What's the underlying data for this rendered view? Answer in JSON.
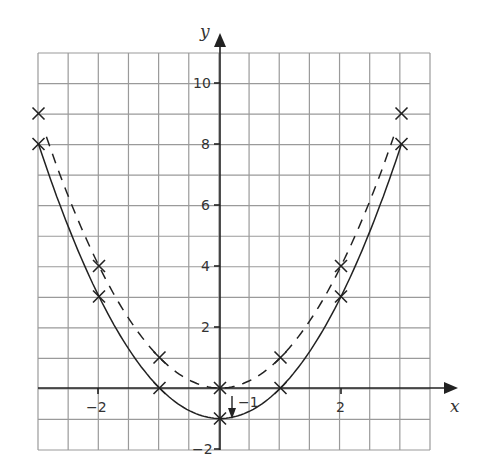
{
  "chart_data": {
    "type": "line",
    "title": "",
    "xlabel": "x",
    "ylabel": "y",
    "xlim": [
      -3,
      3.5
    ],
    "ylim": [
      -2,
      11
    ],
    "grid": true,
    "x_tick_labels": [
      "-2",
      "2"
    ],
    "y_tick_labels": [
      "-2",
      "2",
      "4",
      "6",
      "8",
      "10"
    ],
    "series": [
      {
        "name": "y = x^2",
        "style": "dashed",
        "marker": "x",
        "x": [
          -3,
          -2,
          -1,
          0,
          1,
          2,
          3
        ],
        "y": [
          9,
          4,
          1,
          0,
          1,
          4,
          9
        ]
      },
      {
        "name": "y = x^2 - 1",
        "style": "solid",
        "marker": "x",
        "x": [
          -3,
          -2,
          -1,
          0,
          1,
          2,
          3
        ],
        "y": [
          8,
          3,
          0,
          -1,
          0,
          3,
          8
        ]
      }
    ],
    "annotations": [
      {
        "text": "-1",
        "description": "downward arrow showing translation of vertex from (0,0) to (0,-1)"
      }
    ]
  },
  "labels": {
    "x_axis": "x",
    "y_axis": "y",
    "annotation": "−1",
    "xticks": [
      "−2",
      "2"
    ],
    "yticks": [
      "10",
      "8",
      "6",
      "4",
      "2",
      "−2"
    ]
  }
}
